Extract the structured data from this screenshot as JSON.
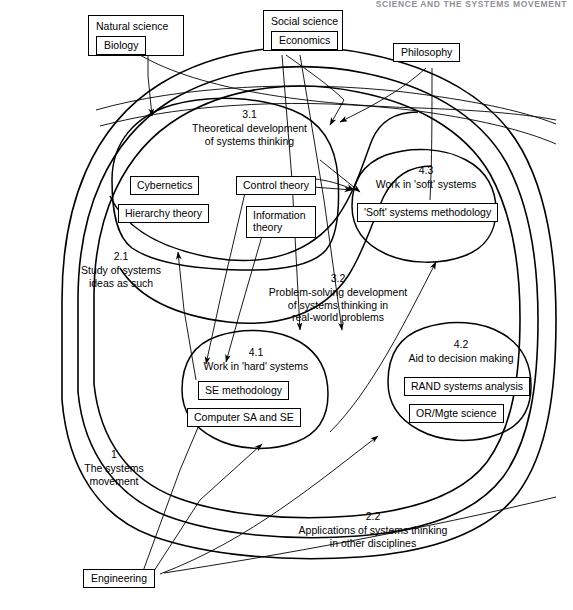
{
  "running_head": "SCIENCE AND THE SYSTEMS MOVEMENT",
  "disciplines": {
    "natural_science": {
      "title": "Natural science",
      "item": "Biology"
    },
    "social_science": {
      "title": "Social science",
      "item": "Economics"
    },
    "philosophy": {
      "label": "Philosophy"
    },
    "engineering": {
      "label": "Engineering"
    }
  },
  "regions": {
    "movement": {
      "num": "1",
      "line1": "The systems",
      "line2": "movement"
    },
    "study_ideas": {
      "num": "2.1",
      "line1": "Study of systems",
      "line2": "ideas as such"
    },
    "applications": {
      "num": "2.2",
      "line1": "Applications of systems thinking",
      "line2": "in other disciplines"
    },
    "theoretical": {
      "num": "3.1",
      "line1": "Theoretical development",
      "line2": "of systems thinking"
    },
    "problem_solving": {
      "num": "3.2",
      "line1": "Problem-solving development",
      "line2": "of systems thinking in",
      "line3": "real-world problems"
    },
    "hard_systems": {
      "num": "4.1",
      "line1": "Work in 'hard' systems"
    },
    "decision_making": {
      "num": "4.2",
      "line1": "Aid to decision making"
    },
    "soft_systems": {
      "num": "4.3",
      "line1": "Work in 'soft' systems"
    }
  },
  "items": {
    "cybernetics": "Cybernetics",
    "hierarchy_theory": "Hierarchy theory",
    "control_theory": "Control theory",
    "information_theory_l1": "Information",
    "information_theory_l2": "theory",
    "se_methodology": "SE methodology",
    "computer_sa_se": "Computer SA and SE",
    "rand_systems_analysis": "RAND systems analysis",
    "or_mgte_science": "OR/Mgte science",
    "soft_systems_methodology": "'Soft' systems methodology"
  },
  "colors": {
    "ink": "#000000",
    "paper": "#ffffff",
    "running_head": "#8f8f96"
  }
}
